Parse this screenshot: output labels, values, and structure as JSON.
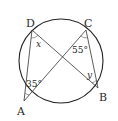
{
  "diagram": {
    "type": "inscribed-angles-circle",
    "circle": {
      "cx": 61,
      "cy": 61,
      "r": 42,
      "stroke": "#222222"
    },
    "points": [
      {
        "id": "D",
        "label": "D",
        "x": 32,
        "y": 30,
        "label_x": 26,
        "label_y": 27
      },
      {
        "id": "C",
        "label": "C",
        "x": 86,
        "y": 30,
        "label_x": 84,
        "label_y": 27
      },
      {
        "id": "A",
        "label": "A",
        "x": 24,
        "y": 101,
        "label_x": 17,
        "label_y": 115
      },
      {
        "id": "B",
        "label": "B",
        "x": 98,
        "y": 88,
        "label_x": 99,
        "label_y": 101
      }
    ],
    "segments": [
      {
        "from": "D",
        "to": "A"
      },
      {
        "from": "D",
        "to": "B"
      },
      {
        "from": "C",
        "to": "A"
      },
      {
        "from": "C",
        "to": "B"
      }
    ],
    "angles": [
      {
        "vertex": "D",
        "label": "x",
        "italic": true,
        "x": 36,
        "y": 46
      },
      {
        "vertex": "C",
        "label": "55°",
        "italic": false,
        "x": 72,
        "y": 52
      },
      {
        "vertex": "A",
        "label": "35°",
        "italic": false,
        "x": 26,
        "y": 86
      },
      {
        "vertex": "B",
        "label": "y",
        "italic": true,
        "x": 87,
        "y": 77
      }
    ],
    "labels": {
      "D": "D",
      "C": "C",
      "A": "A",
      "B": "B",
      "angle_D": "x",
      "angle_C": "55°",
      "angle_A": "35°",
      "angle_B": "y"
    }
  }
}
